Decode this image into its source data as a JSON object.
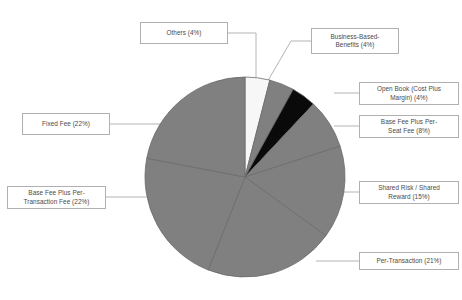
{
  "chart_data": {
    "type": "pie",
    "title": "",
    "subtitle": "",
    "legend_position": "callout-labels",
    "grid": false,
    "start_angle_deg": 0,
    "direction": "clockwise",
    "total_percent": 100,
    "categories": [
      "Others",
      "Business-Based-Benefits",
      "Open Book (Cost Plus Margin)",
      "Base Fee Plus Per-Seat Fee",
      "Shared Risk / Shared Reward",
      "Per-Transaction",
      "Base Fee Plus  Per-Transaction Fee",
      "Fixed Fee"
    ],
    "values": [
      4,
      4,
      4,
      8,
      15,
      21,
      22,
      22
    ],
    "colors": [
      "#f7f7f7",
      "#808080",
      "#0a0a0a",
      "#808080",
      "#808080",
      "#808080",
      "#808080",
      "#808080"
    ],
    "slices": [
      {
        "name": "Others",
        "value": 4,
        "color": "#f7f7f7",
        "label": "Others (4%)"
      },
      {
        "name": "Business-Based-Benefits",
        "value": 4,
        "color": "#808080",
        "label": "Business-Based-Benefits (4%)"
      },
      {
        "name": "Open Book (Cost Plus Margin)",
        "value": 4,
        "color": "#0a0a0a",
        "label": "Open Book (Cost Plus Margin) (4%)"
      },
      {
        "name": "Base Fee Plus Per-Seat Fee",
        "value": 8,
        "color": "#808080",
        "label": "Base Fee Plus Per-Seat Fee (8%)"
      },
      {
        "name": "Shared Risk / Shared Reward",
        "value": 15,
        "color": "#808080",
        "label": "Shared Risk / Shared Reward (15%)"
      },
      {
        "name": "Per-Transaction",
        "value": 21,
        "color": "#808080",
        "label": "Per-Transaction (21%)"
      },
      {
        "name": "Base Fee Plus  Per-Transaction Fee",
        "value": 22,
        "color": "#808080",
        "label": "Base Fee Plus  Per-Transaction Fee (22%)"
      },
      {
        "name": "Fixed Fee",
        "value": 22,
        "color": "#808080",
        "label": "Fixed Fee (22%)"
      }
    ]
  },
  "labels": {
    "others": "Others (4%)",
    "business_based_benefits_line1": "Business-Based-",
    "business_based_benefits_line2": "Benefits (4%)",
    "open_book_line1": "Open Book (Cost Plus",
    "open_book_line2": "Margin) (4%)",
    "base_fee_seat_line1": "Base Fee Plus Per-",
    "base_fee_seat_line2": "Seat Fee (8%)",
    "shared_risk_line1": "Shared Risk / Shared",
    "shared_risk_line2": "Reward (15%)",
    "per_transaction": "Per-Transaction (21%)",
    "base_fee_transaction_line1": "Base Fee Plus  Per-",
    "base_fee_transaction_line2": "Transaction Fee (22%)",
    "fixed_fee": "Fixed Fee (22%)"
  },
  "style": {
    "pie_gray": "#808080",
    "pie_white": "#f7f7f7",
    "pie_black": "#0a0a0a",
    "divider": "#6b6b6b",
    "box_border": "#b0b0b0",
    "text_color": "#4a4a4a",
    "leader_color": "#b4b4b4",
    "background": "#ffffff"
  }
}
